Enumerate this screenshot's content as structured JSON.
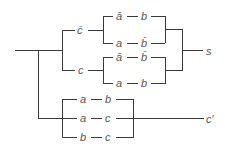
{
  "diagram": {
    "type": "switching-circuit",
    "outputs": {
      "sum": "s",
      "carry": "c′"
    },
    "sum_network": {
      "branches": [
        {
          "control": "c̄",
          "paths": [
            {
              "left": "ā",
              "right": "b"
            },
            {
              "left": "a",
              "right": "b̄"
            }
          ]
        },
        {
          "control": "c",
          "paths": [
            {
              "left": "ā",
              "right": "b̄"
            },
            {
              "left": "a",
              "right": "b"
            }
          ]
        }
      ]
    },
    "carry_network": {
      "paths": [
        {
          "left": "a",
          "right": "b"
        },
        {
          "left": "a",
          "right": "c"
        },
        {
          "left": "b",
          "right": "c"
        }
      ]
    },
    "dash": "—"
  }
}
